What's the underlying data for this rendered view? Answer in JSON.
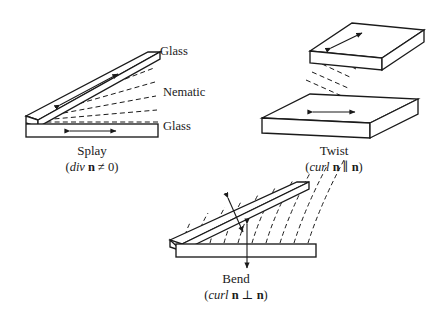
{
  "figure": {
    "background_color": "#ffffff",
    "ink_color": "#1a1a1a"
  },
  "splay": {
    "name": "Splay",
    "equation_open": "(",
    "equation_op": "div",
    "equation_vector": "n",
    "equation_rel": " ≠ 0",
    "equation_close": ")",
    "labels": {
      "top_substrate": "Glass",
      "medium": "Nematic",
      "bottom_substrate": "Glass"
    }
  },
  "twist": {
    "name": "Twist",
    "equation_open": "(",
    "equation_op": "curl",
    "equation_vector_a": "n",
    "equation_rel": " ∥ ",
    "equation_vector_b": "n",
    "equation_close": ")"
  },
  "bend": {
    "name": "Bend",
    "equation_open": "(",
    "equation_op": "curl",
    "equation_vector_a": "n",
    "equation_rel": " ⊥ ",
    "equation_vector_b": "n",
    "equation_close": ")"
  }
}
